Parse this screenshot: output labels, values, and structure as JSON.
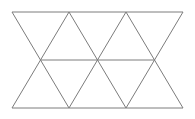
{
  "figure": {
    "canvas": {
      "width": 195,
      "height": 119,
      "background": "#ffffff"
    },
    "style": {
      "stroke_color": "#7c7c7c",
      "stroke_width": 1,
      "fill": "none"
    },
    "geometry": {
      "top_y": 12,
      "middle_y": 60,
      "bottom_y": 108,
      "left_x": 12,
      "right_x": 183,
      "column_step": 28.5,
      "top_vertices_x": [
        12,
        40.5,
        69,
        97.5,
        126,
        154.5,
        183
      ],
      "middle_vertices_x": [
        12,
        40.5,
        69,
        97.5,
        126,
        154.5,
        183
      ],
      "bottom_vertices_x": [
        12,
        40.5,
        69,
        97.5,
        126,
        154.5,
        183
      ]
    },
    "edges": {
      "horizontal": [
        {
          "name": "top-edge",
          "x1": 12,
          "y1": 12,
          "x2": 183,
          "y2": 12
        },
        {
          "name": "middle-edge",
          "x1": 40.5,
          "y1": 60,
          "x2": 154.5,
          "y2": 60
        },
        {
          "name": "bottom-edge",
          "x1": 12,
          "y1": 108,
          "x2": 183,
          "y2": 108
        }
      ],
      "upper_row_diagonals": [
        {
          "name": "upper-diag-1",
          "x1": 12,
          "y1": 12,
          "x2": 40.5,
          "y2": 60
        },
        {
          "name": "upper-diag-2",
          "x1": 69,
          "y1": 12,
          "x2": 40.5,
          "y2": 60
        },
        {
          "name": "upper-diag-3",
          "x1": 69,
          "y1": 12,
          "x2": 97.5,
          "y2": 60
        },
        {
          "name": "upper-diag-4",
          "x1": 126,
          "y1": 12,
          "x2": 97.5,
          "y2": 60
        },
        {
          "name": "upper-diag-5",
          "x1": 126,
          "y1": 12,
          "x2": 154.5,
          "y2": 60
        },
        {
          "name": "upper-diag-6",
          "x1": 183,
          "y1": 12,
          "x2": 154.5,
          "y2": 60
        }
      ],
      "lower_row_diagonals": [
        {
          "name": "lower-diag-1",
          "x1": 40.5,
          "y1": 60,
          "x2": 12,
          "y2": 108
        },
        {
          "name": "lower-diag-2",
          "x1": 40.5,
          "y1": 60,
          "x2": 69,
          "y2": 108
        },
        {
          "name": "lower-diag-3",
          "x1": 97.5,
          "y1": 60,
          "x2": 69,
          "y2": 108
        },
        {
          "name": "lower-diag-4",
          "x1": 97.5,
          "y1": 60,
          "x2": 126,
          "y2": 108
        },
        {
          "name": "lower-diag-5",
          "x1": 154.5,
          "y1": 60,
          "x2": 126,
          "y2": 108
        },
        {
          "name": "lower-diag-6",
          "x1": 154.5,
          "y1": 60,
          "x2": 183,
          "y2": 108
        }
      ]
    },
    "counts": {
      "triangles_total": 12,
      "triangles_upper_row": 6,
      "triangles_lower_row": 6,
      "horizontal_lines": 3,
      "diagonal_lines": 12
    },
    "labels": []
  }
}
